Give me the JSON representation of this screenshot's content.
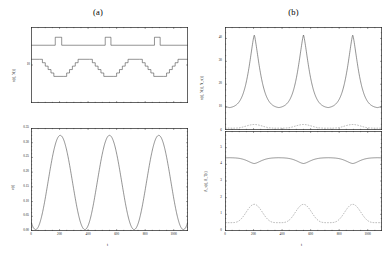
{
  "figure": {
    "panel_a_label": "(a)",
    "panel_b_label": "(b)"
  },
  "chart_data": [
    {
      "id": "a-top",
      "type": "line",
      "title": "(a)",
      "xlabel": "",
      "ylabel": "n(t), N(t)",
      "xlim": [
        0,
        1100
      ],
      "ylim": [
        0,
        20
      ],
      "xticks": [
        0,
        200,
        400,
        600,
        800,
        1000
      ],
      "yticks": [
        10
      ],
      "ytick_labels": [
        "10"
      ],
      "grid": false,
      "legend": "none",
      "series": [
        {
          "name": "N(t) pulse train",
          "style": "step",
          "linestyle": "solid",
          "x": [
            0,
            170,
            170,
            215,
            215,
            520,
            520,
            560,
            560,
            865,
            865,
            905,
            905,
            1100
          ],
          "values": [
            15.2,
            15.2,
            17.3,
            17.3,
            15.2,
            15.2,
            17.3,
            17.3,
            15.2,
            15.2,
            17.3,
            17.3,
            15.2,
            15.2
          ]
        },
        {
          "name": "n(t) staircase",
          "style": "step",
          "linestyle": "solid",
          "x": [
            0,
            60,
            80,
            100,
            120,
            140,
            160,
            230,
            250,
            270,
            290,
            310,
            330,
            410,
            430,
            450,
            470,
            490,
            510,
            580,
            600,
            620,
            640,
            660,
            680,
            760,
            780,
            800,
            820,
            840,
            860,
            930,
            950,
            970,
            990,
            1010,
            1030,
            1100
          ],
          "values": [
            11.5,
            11.5,
            10.6,
            9.7,
            8.8,
            7.9,
            7.0,
            7.0,
            7.9,
            8.8,
            9.7,
            10.6,
            11.5,
            11.5,
            10.6,
            9.7,
            8.8,
            7.9,
            7.0,
            7.0,
            7.9,
            8.8,
            9.7,
            10.6,
            11.5,
            11.5,
            10.6,
            9.7,
            8.8,
            7.9,
            7.0,
            7.0,
            7.9,
            8.8,
            9.7,
            10.6,
            11.5,
            11.5
          ]
        }
      ]
    },
    {
      "id": "a-bottom",
      "type": "line",
      "title": "",
      "xlabel": "t",
      "ylabel": "v(t)",
      "xlim": [
        0,
        1100
      ],
      "ylim": [
        0.0,
        0.35
      ],
      "xticks": [
        0,
        200,
        400,
        600,
        800,
        1000
      ],
      "xtick_labels": [
        "0",
        "200",
        "400",
        "600",
        "800",
        "1000"
      ],
      "yticks": [
        0.0,
        0.05,
        0.1,
        0.15,
        0.2,
        0.25,
        0.3,
        0.35
      ],
      "ytick_labels": [
        "0.00",
        "0.05",
        "0.10",
        "0.15",
        "0.20",
        "0.25",
        "0.30",
        "0.35"
      ],
      "grid": false,
      "legend": "none",
      "series": [
        {
          "name": "v(t)",
          "style": "smooth",
          "linestyle": "solid",
          "description": "sinusoidal oscillation, period approx 345, min 0.005 max 0.325",
          "period": 345,
          "phase_peak_x": 205,
          "min": 0.005,
          "max": 0.325
        }
      ]
    },
    {
      "id": "b-top",
      "type": "line",
      "title": "(b)",
      "xlabel": "",
      "ylabel": "n(t), N(t), N_s(t)",
      "xlim": [
        0,
        1100
      ],
      "ylim": [
        0,
        45
      ],
      "xticks": [
        0,
        200,
        400,
        600,
        800,
        1000
      ],
      "yticks": [
        10,
        20,
        30,
        40
      ],
      "ytick_labels": [
        "10",
        "20",
        "30",
        "40"
      ],
      "grid": false,
      "legend": "none",
      "series": [
        {
          "name": "peaked trace",
          "style": "smooth",
          "linestyle": "solid",
          "description": "sharp periodic spikes peaking at 41.5, baseline 9.5",
          "period": 345,
          "phase_peak_x": 205,
          "min": 9.5,
          "max": 41.5
        },
        {
          "name": "low dashed trace",
          "style": "smooth",
          "linestyle": "dashed",
          "description": "near-flat low amplitude ripple near 1.5",
          "period": 345,
          "phase_peak_x": 205,
          "min": 0.8,
          "max": 2.4
        }
      ]
    },
    {
      "id": "b-bottom",
      "type": "line",
      "title": "",
      "xlabel": "t",
      "ylabel": "A_s(t), A_T(t)",
      "xlim": [
        0,
        1100
      ],
      "ylim": [
        0,
        6
      ],
      "xticks": [
        0,
        200,
        400,
        600,
        800,
        1000
      ],
      "xtick_labels": [
        "0",
        "200",
        "400",
        "600",
        "800",
        "1000"
      ],
      "yticks": [
        0,
        1,
        2,
        3,
        4,
        5,
        6
      ],
      "ytick_labels": [
        "0",
        "1",
        "2",
        "3",
        "4",
        "5",
        "6"
      ],
      "grid": false,
      "legend": "none",
      "series": [
        {
          "name": "A_T(t)",
          "style": "smooth",
          "linestyle": "solid",
          "description": "near constant 4.35 with shallow dips to 4.05 at peak times",
          "period": 345,
          "phase_peak_x": 205,
          "min": 4.05,
          "max": 4.4
        },
        {
          "name": "A_s(t)",
          "style": "smooth",
          "linestyle": "dashed",
          "description": "periodic humps from 0.5 up to 1.6",
          "period": 345,
          "phase_peak_x": 205,
          "min": 0.5,
          "max": 1.6
        }
      ]
    }
  ]
}
